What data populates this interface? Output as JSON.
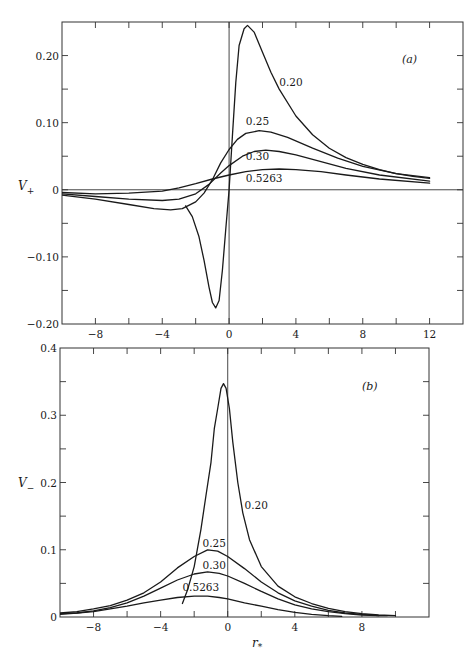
{
  "chart_data": [
    {
      "id": "a",
      "type": "line",
      "panel_label": "(a)",
      "ylabel": "V+",
      "xlabel": "",
      "xlim": [
        -10,
        14
      ],
      "ylim": [
        -0.2,
        0.25
      ],
      "xticks": [
        -8,
        -4,
        0,
        4,
        8,
        12
      ],
      "xtick_labels": [
        "−8",
        "−4",
        "0",
        "4",
        "8",
        "12"
      ],
      "xminor": [
        -10,
        -6,
        -2,
        2,
        6,
        10,
        14
      ],
      "yticks": [
        -0.2,
        -0.1,
        0,
        0.1,
        0.2
      ],
      "ytick_labels": [
        "−0.20",
        "−0.10",
        "0",
        "0.10",
        "0.20"
      ],
      "yminor": [
        -0.15,
        -0.05,
        0.05,
        0.15
      ],
      "grid": false,
      "series": [
        {
          "name": "0.20",
          "label_pos": [
            3.0,
            0.155
          ],
          "points": [
            [
              -2.6,
              -0.024
            ],
            [
              -2.2,
              -0.04
            ],
            [
              -1.8,
              -0.07
            ],
            [
              -1.5,
              -0.105
            ],
            [
              -1.2,
              -0.145
            ],
            [
              -1.0,
              -0.168
            ],
            [
              -0.8,
              -0.176
            ],
            [
              -0.6,
              -0.165
            ],
            [
              -0.4,
              -0.12
            ],
            [
              -0.2,
              -0.06
            ],
            [
              0.0,
              0.0
            ],
            [
              0.2,
              0.08
            ],
            [
              0.4,
              0.16
            ],
            [
              0.6,
              0.215
            ],
            [
              0.9,
              0.24
            ],
            [
              1.1,
              0.245
            ],
            [
              1.5,
              0.235
            ],
            [
              2.0,
              0.205
            ],
            [
              2.5,
              0.175
            ],
            [
              3.0,
              0.15
            ],
            [
              4.0,
              0.11
            ],
            [
              5.0,
              0.082
            ],
            [
              6.0,
              0.062
            ],
            [
              7.0,
              0.048
            ],
            [
              8.0,
              0.038
            ],
            [
              9.0,
              0.03
            ],
            [
              10.0,
              0.024
            ],
            [
              11.0,
              0.02
            ],
            [
              12.0,
              0.017
            ]
          ]
        },
        {
          "name": "0.25",
          "label_pos": [
            1.0,
            0.097
          ],
          "points": [
            [
              -10,
              -0.008
            ],
            [
              -8,
              -0.014
            ],
            [
              -6,
              -0.022
            ],
            [
              -4.5,
              -0.028
            ],
            [
              -3.5,
              -0.03
            ],
            [
              -2.8,
              -0.028
            ],
            [
              -2.0,
              -0.018
            ],
            [
              -1.5,
              -0.005
            ],
            [
              -1.0,
              0.015
            ],
            [
              -0.5,
              0.04
            ],
            [
              0.0,
              0.06
            ],
            [
              0.5,
              0.075
            ],
            [
              1.0,
              0.084
            ],
            [
              1.8,
              0.088
            ],
            [
              2.5,
              0.086
            ],
            [
              3.5,
              0.078
            ],
            [
              5.0,
              0.062
            ],
            [
              6.5,
              0.047
            ],
            [
              8.0,
              0.035
            ],
            [
              10.0,
              0.024
            ],
            [
              12.0,
              0.018
            ]
          ]
        },
        {
          "name": "0.30",
          "label_pos": [
            1.0,
            0.045
          ],
          "points": [
            [
              -10,
              -0.006
            ],
            [
              -8,
              -0.01
            ],
            [
              -6,
              -0.014
            ],
            [
              -4,
              -0.016
            ],
            [
              -3,
              -0.014
            ],
            [
              -2,
              -0.006
            ],
            [
              -1.2,
              0.008
            ],
            [
              -0.5,
              0.025
            ],
            [
              0.0,
              0.036
            ],
            [
              0.8,
              0.05
            ],
            [
              1.5,
              0.057
            ],
            [
              2.2,
              0.059
            ],
            [
              3.0,
              0.057
            ],
            [
              4.0,
              0.052
            ],
            [
              5.5,
              0.042
            ],
            [
              7.0,
              0.032
            ],
            [
              9.0,
              0.022
            ],
            [
              12.0,
              0.013
            ]
          ]
        },
        {
          "name": "0.5263",
          "label_pos": [
            1.0,
            0.012
          ],
          "points": [
            [
              -10,
              -0.004
            ],
            [
              -8,
              -0.006
            ],
            [
              -6,
              -0.005
            ],
            [
              -4,
              -0.002
            ],
            [
              -3,
              0.003
            ],
            [
              -2,
              0.009
            ],
            [
              -1,
              0.016
            ],
            [
              0.0,
              0.022
            ],
            [
              1.0,
              0.027
            ],
            [
              2.0,
              0.03
            ],
            [
              3.0,
              0.031
            ],
            [
              4.0,
              0.03
            ],
            [
              5.5,
              0.027
            ],
            [
              7.0,
              0.022
            ],
            [
              9.0,
              0.016
            ],
            [
              12.0,
              0.01
            ]
          ]
        }
      ]
    },
    {
      "id": "b",
      "type": "line",
      "panel_label": "(b)",
      "ylabel": "V−",
      "xlabel": "r*",
      "xlim": [
        -10,
        12
      ],
      "ylim": [
        0,
        0.4
      ],
      "xticks": [
        -8,
        -4,
        0,
        4,
        8
      ],
      "xtick_labels": [
        "−8",
        "−4",
        "0",
        "4",
        "8"
      ],
      "xminor": [
        -10,
        -6,
        -2,
        2,
        6,
        10
      ],
      "yticks": [
        0,
        0.1,
        0.2,
        0.3,
        0.4
      ],
      "ytick_labels": [
        "0",
        "0.1",
        "0.2",
        "0.3",
        "0.4"
      ],
      "yminor": [
        0.05,
        0.15,
        0.25,
        0.35
      ],
      "grid": false,
      "series": [
        {
          "name": "0.20",
          "label_pos": [
            1.0,
            0.16
          ],
          "points": [
            [
              -2.7,
              0.02
            ],
            [
              -2.4,
              0.04
            ],
            [
              -2.0,
              0.075
            ],
            [
              -1.6,
              0.13
            ],
            [
              -1.3,
              0.18
            ],
            [
              -1.0,
              0.23
            ],
            [
              -0.8,
              0.28
            ],
            [
              -0.6,
              0.31
            ],
            [
              -0.4,
              0.34
            ],
            [
              -0.25,
              0.347
            ],
            [
              -0.1,
              0.34
            ],
            [
              0.1,
              0.31
            ],
            [
              0.3,
              0.26
            ],
            [
              0.6,
              0.2
            ],
            [
              0.9,
              0.155
            ],
            [
              1.3,
              0.115
            ],
            [
              2.0,
              0.075
            ],
            [
              3.0,
              0.046
            ],
            [
              4.0,
              0.03
            ],
            [
              5.0,
              0.02
            ],
            [
              6.0,
              0.013
            ],
            [
              7.0,
              0.008
            ],
            [
              8.0,
              0.005
            ],
            [
              9.0,
              0.003
            ],
            [
              10.0,
              0.002
            ]
          ]
        },
        {
          "name": "0.25",
          "label_pos": [
            -1.5,
            0.104
          ],
          "points": [
            [
              -10,
              0.006
            ],
            [
              -9,
              0.008
            ],
            [
              -8,
              0.012
            ],
            [
              -7,
              0.017
            ],
            [
              -6,
              0.025
            ],
            [
              -5,
              0.036
            ],
            [
              -4,
              0.052
            ],
            [
              -3,
              0.073
            ],
            [
              -2,
              0.09
            ],
            [
              -1.2,
              0.1
            ],
            [
              -0.6,
              0.098
            ],
            [
              0.0,
              0.09
            ],
            [
              1.0,
              0.072
            ],
            [
              2.0,
              0.052
            ],
            [
              3.0,
              0.036
            ],
            [
              4.0,
              0.024
            ],
            [
              5.0,
              0.016
            ],
            [
              6.0,
              0.01
            ],
            [
              7.0,
              0.006
            ],
            [
              8.0,
              0.004
            ],
            [
              9.0,
              0.002
            ],
            [
              9.5,
              0.002
            ]
          ]
        },
        {
          "name": "0.30",
          "label_pos": [
            -1.5,
            0.071
          ],
          "points": [
            [
              -10,
              0.004
            ],
            [
              -9,
              0.006
            ],
            [
              -8,
              0.009
            ],
            [
              -7,
              0.014
            ],
            [
              -6,
              0.021
            ],
            [
              -5,
              0.031
            ],
            [
              -4,
              0.043
            ],
            [
              -3,
              0.055
            ],
            [
              -2,
              0.064
            ],
            [
              -1.2,
              0.067
            ],
            [
              -0.5,
              0.065
            ],
            [
              0.0,
              0.061
            ],
            [
              1.0,
              0.05
            ],
            [
              2.0,
              0.038
            ],
            [
              3.0,
              0.027
            ],
            [
              4.0,
              0.018
            ],
            [
              5.0,
              0.012
            ],
            [
              6.0,
              0.008
            ],
            [
              7.0,
              0.005
            ],
            [
              8.0,
              0.003
            ],
            [
              9.0,
              0.002
            ]
          ]
        },
        {
          "name": "0.5263",
          "label_pos": [
            -2.7,
            0.038
          ],
          "points": [
            [
              -10,
              0.005
            ],
            [
              -9,
              0.006
            ],
            [
              -8,
              0.008
            ],
            [
              -7,
              0.012
            ],
            [
              -6,
              0.016
            ],
            [
              -5,
              0.021
            ],
            [
              -4,
              0.025
            ],
            [
              -3,
              0.029
            ],
            [
              -2,
              0.031
            ],
            [
              -1.2,
              0.031
            ],
            [
              -0.5,
              0.029
            ],
            [
              0.0,
              0.027
            ],
            [
              1.0,
              0.021
            ],
            [
              2.0,
              0.016
            ],
            [
              3.0,
              0.011
            ],
            [
              4.0,
              0.007
            ],
            [
              5.0,
              0.004
            ],
            [
              6.0,
              0.002
            ],
            [
              6.8,
              0.001
            ]
          ]
        }
      ]
    }
  ],
  "layout": {
    "panels": [
      {
        "id": "a",
        "left": 62,
        "right": 463,
        "top": 22,
        "bottom": 324,
        "x0": -10,
        "x1": 14,
        "y0": -0.2,
        "y1": 0.25,
        "ylabel_x": 18,
        "ylabel_y": 190,
        "panel_label_x": 402,
        "panel_label_y": 63
      },
      {
        "id": "b",
        "left": 60,
        "right": 429,
        "top": 348,
        "bottom": 617,
        "x0": -10,
        "x1": 12,
        "y0": 0,
        "y1": 0.4,
        "ylabel_x": 18,
        "ylabel_y": 487,
        "panel_label_x": 362,
        "panel_label_y": 390,
        "xlabel_x": 252,
        "xlabel_y": 647
      }
    ]
  },
  "caption": "Figure: (a) Potential V+ and (b) potential V− versus r* (caption cut off)"
}
